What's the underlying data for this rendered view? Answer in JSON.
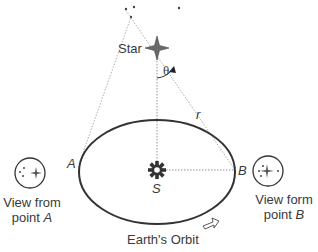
{
  "diagram": {
    "labels": {
      "star": "Star",
      "theta": "θ",
      "r": "r",
      "point_a": "A",
      "point_b": "B",
      "sun": "S",
      "orbit": "Earth's Orbit",
      "view_a_line1": "View from",
      "view_a_line2_prefix": "point ",
      "view_a_line2_point": "A",
      "view_b_line1": "View form",
      "view_b_line2_prefix": "point ",
      "view_b_line2_point": "B"
    },
    "colors": {
      "line": "#333333",
      "dotted": "#888888",
      "star_fill": "#666666",
      "background": "#ffffff"
    }
  }
}
